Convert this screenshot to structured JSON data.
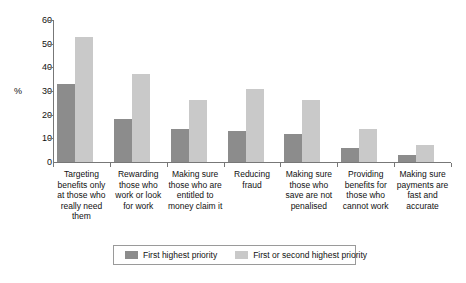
{
  "chart_data": {
    "type": "bar",
    "title": "",
    "xlabel": "",
    "ylabel": "%",
    "ylim": [
      0,
      60
    ],
    "yticks": [
      0,
      10,
      20,
      30,
      40,
      50,
      60
    ],
    "grid": false,
    "legend_position": "bottom",
    "categories": [
      "Targeting benefits only at those who really need them",
      "Rewarding those who work or look for work",
      "Making sure those who are entitled to money claim it",
      "Reducing fraud",
      "Making sure those who save are not penalised",
      "Providing benefits for those who cannot work",
      "Making sure payments are fast and accurate"
    ],
    "series": [
      {
        "name": "First highest priority",
        "color": "#8c8c8c",
        "values": [
          33,
          18,
          14,
          13,
          12,
          6,
          3
        ]
      },
      {
        "name": "First or second highest priority",
        "color": "#c9c9c9",
        "values": [
          53,
          37,
          26,
          31,
          26,
          14,
          7
        ]
      }
    ]
  },
  "axis": {
    "y_title": "%",
    "y_tick_labels": [
      "0",
      "10",
      "20",
      "30",
      "40",
      "50",
      "60"
    ]
  },
  "legend": {
    "items": [
      {
        "label": "First highest priority",
        "color": "#8c8c8c"
      },
      {
        "label": "First or second highest priority",
        "color": "#c9c9c9"
      }
    ]
  },
  "colors": {
    "series_first": "#8c8c8c",
    "series_first_or_second": "#c9c9c9",
    "axis": "#777777",
    "background": "#ffffff",
    "text": "#111111"
  }
}
